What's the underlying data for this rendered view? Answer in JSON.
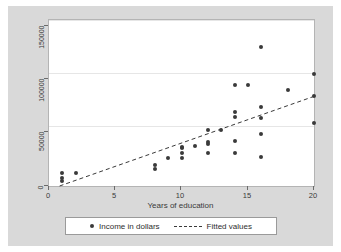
{
  "figure": {
    "background_color": "#d9d9d9",
    "plot_background_color": "#ffffff",
    "marker_color": "#3a3a3a",
    "grid_color": "#e6e6e6"
  },
  "axes": {
    "x_title": "Years of education",
    "y_title": "",
    "x_ticks": [
      "0",
      "5",
      "10",
      "15",
      "20"
    ],
    "y_ticks": [
      "0",
      "50000",
      "100000",
      "150000"
    ]
  },
  "legend": {
    "scatter_label": "Income in dollars",
    "fit_label": "Fitted values"
  },
  "chart_data": {
    "type": "scatter",
    "title": "",
    "xlabel": "Years of education",
    "ylabel": "",
    "xlim": [
      0,
      20
    ],
    "ylim": [
      0,
      150000
    ],
    "xticks": [
      0,
      5,
      10,
      15,
      20
    ],
    "yticks": [
      0,
      50000,
      100000,
      150000
    ],
    "grid": true,
    "legend_position": "below-plot",
    "series": [
      {
        "name": "Income in dollars",
        "type": "scatter",
        "marker": "circle",
        "color": "#3a3a3a",
        "points": [
          {
            "x": 1,
            "y": 12000
          },
          {
            "x": 1,
            "y": 7000
          },
          {
            "x": 1,
            "y": 4500
          },
          {
            "x": 2,
            "y": 12000
          },
          {
            "x": 8,
            "y": 19000
          },
          {
            "x": 8,
            "y": 15000
          },
          {
            "x": 9,
            "y": 25000
          },
          {
            "x": 10,
            "y": 35000
          },
          {
            "x": 10,
            "y": 34000
          },
          {
            "x": 10,
            "y": 30000
          },
          {
            "x": 10,
            "y": 25000
          },
          {
            "x": 11,
            "y": 36000
          },
          {
            "x": 12,
            "y": 51000
          },
          {
            "x": 12,
            "y": 40000
          },
          {
            "x": 12,
            "y": 38000
          },
          {
            "x": 12,
            "y": 30000
          },
          {
            "x": 13,
            "y": 51000
          },
          {
            "x": 14,
            "y": 91000
          },
          {
            "x": 14,
            "y": 67000
          },
          {
            "x": 14,
            "y": 62000
          },
          {
            "x": 14,
            "y": 41000
          },
          {
            "x": 14,
            "y": 30000
          },
          {
            "x": 15,
            "y": 91000
          },
          {
            "x": 16,
            "y": 126000
          },
          {
            "x": 16,
            "y": 71000
          },
          {
            "x": 16,
            "y": 61000
          },
          {
            "x": 16,
            "y": 47000
          },
          {
            "x": 16,
            "y": 26000
          },
          {
            "x": 18,
            "y": 87000
          },
          {
            "x": 20,
            "y": 101000
          },
          {
            "x": 20,
            "y": 81000
          },
          {
            "x": 20,
            "y": 57000
          }
        ]
      },
      {
        "name": "Fitted values",
        "type": "line",
        "style": "dashed",
        "color": "#3a3a3a",
        "endpoints": [
          {
            "x": 0.8,
            "y": 0
          },
          {
            "x": 20,
            "y": 81000
          }
        ]
      }
    ]
  }
}
